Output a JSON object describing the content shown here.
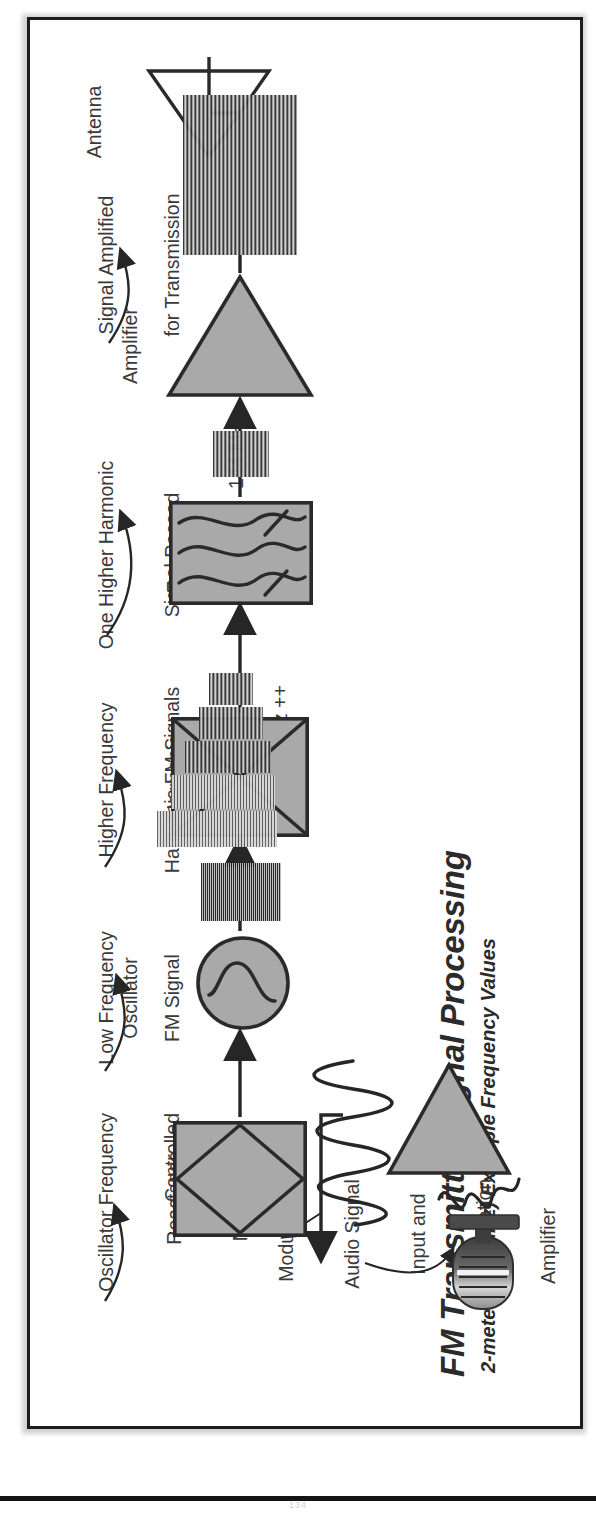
{
  "figure": {
    "title": "FM Transmitter Signal Processing",
    "subtitle": "2-meter (144 MHz) Example Frequency Values",
    "folio": "134"
  },
  "annotations": [
    {
      "id": "ann-signal-amplified",
      "line1": "Signal Amplified",
      "line2": "for Transmission"
    },
    {
      "id": "ann-one-higher-harmonic",
      "line1": "One Higher Harmonic",
      "line2": "Signal Passed"
    },
    {
      "id": "ann-higher-frequency",
      "line1": "Higher Frequency",
      "line2": "Harmonic FM Signals"
    },
    {
      "id": "ann-low-frequency",
      "line1": "Low Frequency",
      "line2": "FM Signal"
    },
    {
      "id": "ann-oscillator-frequency",
      "line1": "Oscillator Frequency",
      "line2": "Controlled"
    },
    {
      "id": "ann-modulating-audio",
      "line1": "Modulating",
      "line2": "Audio Signal",
      "line3": "Input and",
      "line4": "Amplification"
    }
  ],
  "blocks": [
    {
      "id": "block-antenna",
      "label": "Antenna",
      "shape": "antenna-triangle"
    },
    {
      "id": "block-amplifier",
      "label": "Amplifier",
      "shape": "triangle"
    },
    {
      "id": "block-frequency-filter",
      "line1": "Frequency",
      "line2": "Filter",
      "shape": "rectangle"
    },
    {
      "id": "block-harmonic-multiplier",
      "line1": "Harmonic",
      "line2": "Multiplier",
      "shape": "bowtie-rectangle"
    },
    {
      "id": "block-oscillator",
      "label": "Oscillator",
      "shape": "circle-sine"
    },
    {
      "id": "block-reactance-modulator",
      "line1": "Reactance",
      "line2": "Modulator",
      "shape": "diamond-rectangle"
    },
    {
      "id": "block-speech-amplifier",
      "line1": "Speech",
      "line2": "Amplifier",
      "shape": "triangle"
    },
    {
      "id": "block-microphone",
      "label": "",
      "shape": "microphone"
    }
  ],
  "frequencies": [
    {
      "id": "freq-144",
      "value": "144 MHz"
    },
    {
      "id": "freq-harmonics-24",
      "value": "24 MHz"
    },
    {
      "id": "freq-harmonics-36",
      "value": "36 MHz..."
    },
    {
      "id": "freq-harmonics-144",
      "value": "... 144 MHz ++"
    },
    {
      "id": "freq-12",
      "value": "12 MHz"
    }
  ],
  "colors": {
    "block_fill": "#a9a9a9",
    "stroke": "#2a2a2a",
    "text": "#3a3a3a",
    "frame": "#1c1c1c",
    "page": "#ffffff"
  }
}
